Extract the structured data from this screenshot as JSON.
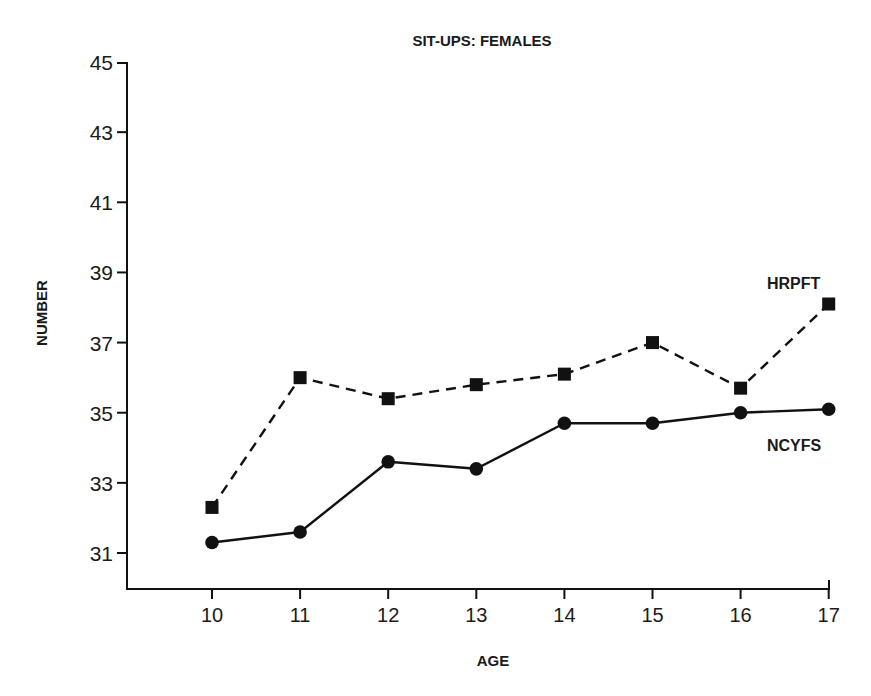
{
  "chart_data": {
    "type": "line",
    "title": "SIT-UPS: FEMALES",
    "xlabel": "AGE",
    "ylabel": "NUMBER",
    "x": [
      10,
      11,
      12,
      13,
      14,
      15,
      16,
      17
    ],
    "x_tick_labels": [
      "10",
      "11",
      "12",
      "13",
      "14",
      "15",
      "16",
      "17"
    ],
    "y_ticks": [
      31,
      33,
      35,
      37,
      39,
      41,
      43,
      45
    ],
    "y_tick_labels": [
      "31",
      "33",
      "35",
      "37",
      "39",
      "41",
      "43",
      "45"
    ],
    "ylim": [
      30,
      45
    ],
    "xlim": [
      9,
      17
    ],
    "grid": false,
    "legend_position": "inline-right",
    "series": [
      {
        "name": "HRPFT",
        "marker": "square",
        "line_style": "dashed",
        "color": "#111111",
        "values": [
          32.3,
          36.0,
          35.4,
          35.8,
          36.1,
          37.0,
          35.7,
          38.1
        ]
      },
      {
        "name": "NCYFS",
        "marker": "circle",
        "line_style": "solid",
        "color": "#111111",
        "values": [
          31.3,
          31.6,
          33.6,
          33.4,
          34.7,
          34.7,
          35.0,
          35.1
        ]
      }
    ]
  }
}
